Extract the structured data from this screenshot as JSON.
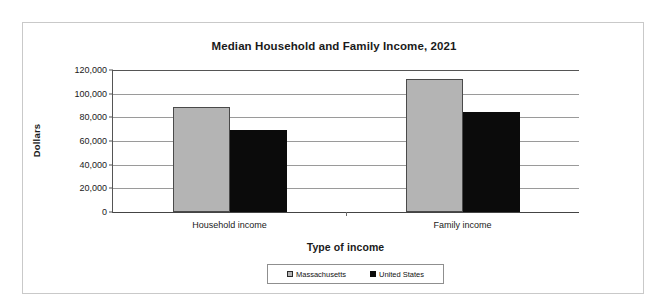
{
  "scan_artifact": "",
  "chart_data": {
    "type": "bar",
    "title": "Median Household and Family Income, 2021",
    "xlabel": "Type of income",
    "ylabel": "Dollars",
    "categories": [
      "Household income",
      "Family income"
    ],
    "series": [
      {
        "name": "Massachusetts",
        "color": "#b4b4b4",
        "values": [
          89000,
          112500
        ]
      },
      {
        "name": "United States",
        "color": "#0b0b0b",
        "values": [
          69000,
          84500
        ]
      }
    ],
    "ylim": [
      0,
      120000
    ],
    "ytick_values": [
      0,
      20000,
      40000,
      60000,
      80000,
      100000,
      120000
    ],
    "ytick_labels": [
      "0",
      "20,000",
      "40,000",
      "60,000",
      "80,000",
      "100,000",
      "120,000"
    ],
    "grid": true,
    "legend_position": "bottom",
    "legend_entries": [
      "Massachusetts",
      "United States"
    ]
  }
}
